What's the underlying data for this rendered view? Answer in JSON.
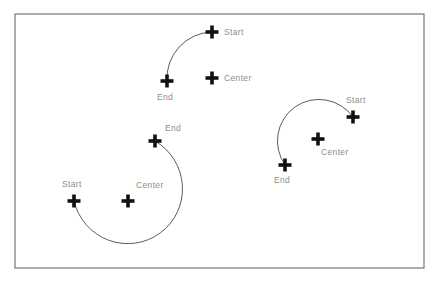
{
  "diagram": {
    "background_color": "#ffffff",
    "frame": {
      "x": 15,
      "y": 14,
      "width": 409,
      "height": 254,
      "stroke_color": "#6b6b6b"
    },
    "style": {
      "arc_stroke_color": "#4a4a4a",
      "marker_color": "#111111",
      "label_color": "#8d8d8d",
      "marker_arm_length": 13,
      "marker_stroke_width": 3.6
    },
    "arcs": [
      {
        "id": "arc-top",
        "name": "top-quarter-arc",
        "center": {
          "x": 212,
          "y": 78,
          "label": "Center"
        },
        "start": {
          "x": 212,
          "y": 32,
          "label": "Start"
        },
        "end": {
          "x": 167,
          "y": 81,
          "label": "End"
        },
        "radius": 46,
        "sweep": "counterclockwise",
        "sweep_degrees": 94,
        "path": "M 212 32 A 46 46 0 0 0 167 81"
      },
      {
        "id": "arc-bottom-left",
        "name": "bottom-left-major-arc",
        "center": {
          "x": 128,
          "y": 201,
          "label": "Center"
        },
        "start": {
          "x": 74,
          "y": 201,
          "label": "Start"
        },
        "end": {
          "x": 155,
          "y": 141,
          "label": "End"
        },
        "radius": 55,
        "sweep": "clockwise",
        "sweep_degrees": 272,
        "path": "M 74 201 A 55 55 0 1 0 155 141"
      },
      {
        "id": "arc-right",
        "name": "right-major-arc",
        "center": {
          "x": 318,
          "y": 139,
          "label": "Center"
        },
        "start": {
          "x": 353,
          "y": 117,
          "label": "Start"
        },
        "end": {
          "x": 285,
          "y": 165,
          "label": "End"
        },
        "radius": 41,
        "sweep": "counterclockwise",
        "sweep_degrees": 208,
        "path": "M 353 117 A 41 41 0 1 0 285 165"
      }
    ],
    "labels": [
      {
        "id": "lbl-top-start",
        "text": "Start",
        "x": 224,
        "y": 28,
        "for": "arc-top / start"
      },
      {
        "id": "lbl-top-center",
        "text": "Center",
        "x": 224,
        "y": 74,
        "for": "arc-top / center"
      },
      {
        "id": "lbl-top-end",
        "text": "End",
        "x": 157,
        "y": 93,
        "for": "arc-top / end"
      },
      {
        "id": "lbl-bl-end",
        "text": "End",
        "x": 165,
        "y": 124,
        "for": "arc-bottom-left / end"
      },
      {
        "id": "lbl-bl-start",
        "text": "Start",
        "x": 62,
        "y": 180,
        "for": "arc-bottom-left / start"
      },
      {
        "id": "lbl-bl-center",
        "text": "Center",
        "x": 136,
        "y": 181,
        "for": "arc-bottom-left / center"
      },
      {
        "id": "lbl-right-start",
        "text": "Start",
        "x": 346,
        "y": 96,
        "for": "arc-right / start"
      },
      {
        "id": "lbl-right-center",
        "text": "Center",
        "x": 321,
        "y": 148,
        "for": "arc-right / center"
      },
      {
        "id": "lbl-right-end",
        "text": "End",
        "x": 274,
        "y": 176,
        "for": "arc-right / end"
      }
    ]
  }
}
